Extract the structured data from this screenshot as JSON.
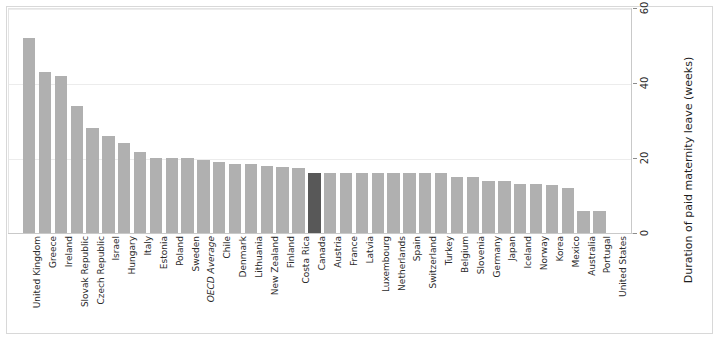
{
  "chart_data": {
    "type": "bar",
    "title": "",
    "xlabel": "",
    "ylabel": "Duration of paid maternity leave (weeks)",
    "ylim": [
      0,
      60
    ],
    "yticks": [
      0,
      20,
      40,
      60
    ],
    "grid": true,
    "legend": "none",
    "highlight_category": "Canada",
    "bar_color": "#b0b0b0",
    "highlight_color": "#585858",
    "grid_color": "#ececec",
    "axis_color": "#c9c9c9",
    "categories": [
      "United Kingdom",
      "Greece",
      "Ireland",
      "Slovak Republic",
      "Czech Republic",
      "Israel",
      "Hungary",
      "Italy",
      "Estonia",
      "Poland",
      "Sweden",
      "OECD Average",
      "Chile",
      "Denmark",
      "Lithuania",
      "New Zealand",
      "Finland",
      "Costa Rica",
      "Canada",
      "Austria",
      "France",
      "Latvia",
      "Luxembourg",
      "Netherlands",
      "Spain",
      "Switzerland",
      "Turkey",
      "Belgium",
      "Slovenia",
      "Germany",
      "Japan",
      "Iceland",
      "Norway",
      "Korea",
      "Mexico",
      "Australia",
      "Portugal",
      "United States"
    ],
    "values": [
      52,
      43,
      42,
      34,
      28,
      26,
      24,
      21.7,
      20,
      20,
      20,
      19.5,
      19,
      18.5,
      18.5,
      18,
      17.5,
      17.3,
      16,
      16,
      16,
      16,
      16,
      16,
      16,
      16,
      16,
      15,
      15,
      14,
      14,
      13,
      13,
      12.8,
      12,
      6,
      6,
      0
    ],
    "italic_categories": [
      "OECD Average"
    ]
  }
}
